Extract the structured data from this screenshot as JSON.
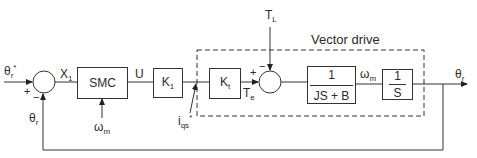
{
  "diagram": {
    "type": "block-diagram",
    "title": "",
    "group": {
      "label": "Vector drive",
      "style": "dashed"
    },
    "blocks": [
      {
        "id": "smc",
        "label": "SMC"
      },
      {
        "id": "k1",
        "label": "K",
        "sub": "1"
      },
      {
        "id": "kt",
        "label": "K",
        "sub": "t"
      },
      {
        "id": "plant",
        "num": "1",
        "den": "JS + B"
      },
      {
        "id": "integrator",
        "num": "1",
        "den": "S"
      }
    ],
    "junctions": [
      {
        "id": "sum1",
        "signs": [
          "+",
          "−"
        ]
      },
      {
        "id": "sum2",
        "signs": [
          "+",
          "−"
        ]
      }
    ],
    "signals": {
      "theta_ref": {
        "base": "θ",
        "sub": "r",
        "sup": "*"
      },
      "x1": {
        "base": "X",
        "sub": "1"
      },
      "u": {
        "base": "U"
      },
      "omega_m_smc": {
        "base": "ω",
        "sub": "m"
      },
      "iqs": {
        "base": "i",
        "sub": "qs",
        "sup": "*"
      },
      "te": {
        "base": "T",
        "sub": "e"
      },
      "tl": {
        "base": "T",
        "sub": "L"
      },
      "omega_m": {
        "base": "ω",
        "sub": "m"
      },
      "theta_out": {
        "base": "θ",
        "sub": "r"
      },
      "theta_fb": {
        "base": "θ",
        "sub": "r"
      }
    },
    "signs": {
      "plus": "+",
      "minus": "−"
    }
  }
}
